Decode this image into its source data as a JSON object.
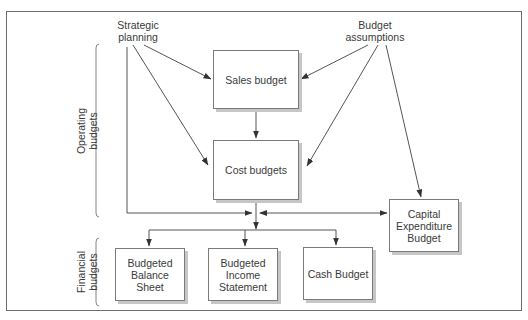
{
  "diagram": {
    "sources": {
      "strategic_planning": "Strategic planning",
      "strategic_planning_l1": "Strategic",
      "strategic_planning_l2": "planning",
      "budget_assumptions": "Budget assumptions",
      "budget_assumptions_l1": "Budget",
      "budget_assumptions_l2": "assumptions"
    },
    "groups": {
      "operating": {
        "l1": "Operating",
        "l2": "budgets"
      },
      "financial": {
        "l1": "Financial",
        "l2": "budgets"
      }
    },
    "boxes": {
      "sales_budget": "Sales budget",
      "cost_budgets": "Cost budgets",
      "capital_expenditure": {
        "l1": "Capital",
        "l2": "Expenditure",
        "l3": "Budget"
      },
      "balance_sheet": {
        "l1": "Budgeted",
        "l2": "Balance",
        "l3": "Sheet"
      },
      "income_statement": {
        "l1": "Budgeted",
        "l2": "Income",
        "l3": "Statement"
      },
      "cash_budget": "Cash Budget"
    },
    "edges": [
      {
        "from": "Strategic planning",
        "to": "Sales budget"
      },
      {
        "from": "Strategic planning",
        "to": "Cost budgets"
      },
      {
        "from": "Strategic planning",
        "to": "Financial budgets junction"
      },
      {
        "from": "Budget assumptions",
        "to": "Sales budget"
      },
      {
        "from": "Budget assumptions",
        "to": "Cost budgets"
      },
      {
        "from": "Budget assumptions",
        "to": "Capital Expenditure Budget"
      },
      {
        "from": "Sales budget",
        "to": "Cost budgets"
      },
      {
        "from": "Cost budgets",
        "to": "Financial budgets junction"
      },
      {
        "from": "Capital Expenditure Budget",
        "to": "Financial budgets junction",
        "bidirectional": true
      },
      {
        "from": "Financial budgets junction",
        "to": "Budgeted Balance Sheet"
      },
      {
        "from": "Financial budgets junction",
        "to": "Budgeted Income Statement"
      },
      {
        "from": "Financial budgets junction",
        "to": "Cash Budget"
      }
    ],
    "colors": {
      "line": "#555555",
      "border": "#7a7a7a",
      "shadow": "#c6c6c6",
      "text": "#3a3a3a"
    }
  }
}
